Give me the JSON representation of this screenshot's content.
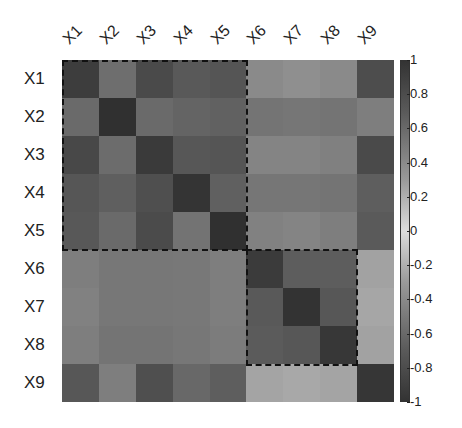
{
  "chart_data": {
    "type": "heatmap",
    "title": "",
    "xlabel": "",
    "ylabel": "",
    "x_labels": [
      "X1",
      "X2",
      "X3",
      "X4",
      "X5",
      "X6",
      "X7",
      "X8",
      "X9"
    ],
    "y_labels": [
      "X1",
      "X2",
      "X3",
      "X4",
      "X5",
      "X6",
      "X7",
      "X8",
      "X9"
    ],
    "values": [
      [
        1.0,
        0.55,
        0.8,
        0.7,
        0.72,
        0.35,
        0.32,
        0.35,
        0.78
      ],
      [
        0.55,
        1.0,
        0.55,
        0.6,
        0.62,
        0.5,
        0.48,
        0.5,
        0.45
      ],
      [
        0.8,
        0.55,
        1.0,
        0.7,
        0.72,
        0.4,
        0.4,
        0.42,
        0.8
      ],
      [
        0.7,
        0.6,
        0.7,
        1.0,
        0.65,
        0.48,
        0.48,
        0.5,
        0.65
      ],
      [
        0.72,
        0.62,
        0.72,
        0.65,
        1.0,
        0.42,
        0.4,
        0.45,
        0.68
      ],
      [
        0.4,
        0.45,
        0.45,
        0.45,
        0.42,
        1.0,
        0.75,
        0.75,
        0.22
      ],
      [
        0.38,
        0.45,
        0.45,
        0.45,
        0.4,
        0.75,
        1.0,
        0.78,
        0.2
      ],
      [
        0.4,
        0.48,
        0.48,
        0.45,
        0.42,
        0.75,
        0.78,
        1.0,
        0.22
      ],
      [
        0.78,
        0.45,
        0.8,
        0.62,
        0.68,
        0.22,
        0.2,
        0.22,
        1.0
      ]
    ],
    "gray_levels": [
      [
        "#3d3d3d",
        "#6e6e6e",
        "#4a4a4a",
        "#595959",
        "#555555",
        "#8a8a8a",
        "#8f8f8f",
        "#8a8a8a",
        "#4d4d4d"
      ],
      [
        "#6a6a6a",
        "#303030",
        "#6a6a6a",
        "#646464",
        "#616161",
        "#747474",
        "#767676",
        "#747474",
        "#7e7e7e"
      ],
      [
        "#484848",
        "#6c6c6c",
        "#3a3a3a",
        "#575757",
        "#555555",
        "#848484",
        "#848484",
        "#808080",
        "#4a4a4a"
      ],
      [
        "#565656",
        "#5f5f5f",
        "#4f4f4f",
        "#343434",
        "#606060",
        "#767676",
        "#767676",
        "#747474",
        "#5e5e5e"
      ],
      [
        "#585858",
        "#6a6a6a",
        "#4b4b4b",
        "#737373",
        "#303030",
        "#818181",
        "#848484",
        "#7e7e7e",
        "#5a5a5a"
      ],
      [
        "#7e7e7e",
        "#777777",
        "#777777",
        "#787878",
        "#7e7e7e",
        "#3b3b3b",
        "#5d5d5d",
        "#5d5d5d",
        "#a2a2a2"
      ],
      [
        "#818181",
        "#777777",
        "#777777",
        "#787878",
        "#7e7e7e",
        "#595959",
        "#333333",
        "#575757",
        "#a6a6a6"
      ],
      [
        "#7e7e7e",
        "#747474",
        "#747474",
        "#777777",
        "#7c7c7c",
        "#5b5b5b",
        "#575757",
        "#373737",
        "#a2a2a2"
      ],
      [
        "#575757",
        "#7e7e7e",
        "#4f4f4f",
        "#686868",
        "#5e5e5e",
        "#a4a4a4",
        "#a8a8a8",
        "#a4a4a4",
        "#363636"
      ]
    ],
    "colorbar": {
      "min": -1,
      "max": 1,
      "ticks": [
        "1",
        "0.8",
        "0.6",
        "0.4",
        "0.2",
        "0",
        "-0.2",
        "-0.4",
        "-0.6",
        "-0.8",
        "-1"
      ]
    },
    "highlight_boxes": [
      {
        "from": "X1",
        "to": "X5"
      },
      {
        "from": "X6",
        "to": "X8"
      }
    ],
    "grid": false,
    "legend_position": "right"
  }
}
